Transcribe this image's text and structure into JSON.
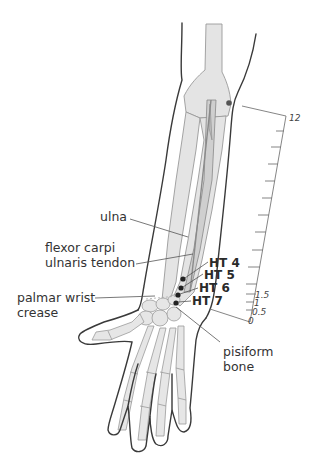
{
  "figure": {
    "colors": {
      "outline": "#3a3a3a",
      "bone_fill": "#e3e3e3",
      "bone_stroke": "#9a9a9a",
      "tendon": "#8c8c8c",
      "point": "#222222",
      "leader": "#555555",
      "text": "#333333"
    }
  },
  "labels": {
    "ulna": "ulna",
    "fcu_line1": "flexor carpi",
    "fcu_line2": "ulnaris tendon",
    "crease_line1": "palmar wrist",
    "crease_line2": "crease",
    "pisiform_line1": "pisiform",
    "pisiform_line2": "bone"
  },
  "points": [
    {
      "id": "HT 4",
      "label": "HT 4"
    },
    {
      "id": "HT 5",
      "label": "HT 5"
    },
    {
      "id": "HT 6",
      "label": "HT 6"
    },
    {
      "id": "HT 7",
      "label": "HT 7"
    }
  ],
  "scale": {
    "top_label": "12",
    "labels": [
      "1.5",
      "1",
      "0.5",
      "0"
    ],
    "unit": "cun"
  }
}
